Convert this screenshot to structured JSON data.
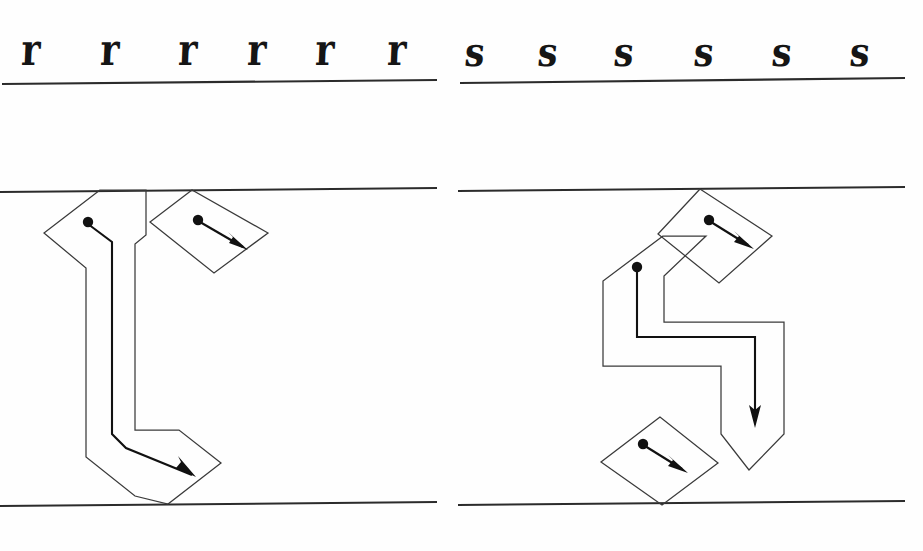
{
  "page": {
    "background_color": "#ffffff",
    "ink_color": "#2b2b2b",
    "width": 923,
    "height": 551
  },
  "specimen_row": {
    "left_group": {
      "letter": "r",
      "letter_name": "blackletter-lowercase-r",
      "count": 6,
      "repeats": [
        "r",
        "r",
        "r",
        "r",
        "r",
        "r"
      ],
      "x_positions": [
        25,
        105,
        184,
        252,
        320,
        392
      ],
      "baseline_y": 82,
      "rule_from_x": 2,
      "rule_to_x": 437
    },
    "right_group": {
      "letter": "s",
      "letter_name": "blackletter-lowercase-s",
      "count": 6,
      "repeats": [
        "s",
        "s",
        "s",
        "s",
        "s",
        "s"
      ],
      "x_positions": [
        472,
        544,
        620,
        700,
        778,
        856
      ],
      "baseline_y": 82,
      "rule_from_x": 460,
      "rule_to_x": 905
    }
  },
  "diagram_area": {
    "guides": {
      "waistline_y": 190,
      "baseline_y": 504,
      "left_panel": {
        "from_x": 0,
        "to_x": 437
      },
      "right_panel": {
        "from_x": 458,
        "to_x": 905
      }
    },
    "left_diagram": {
      "name": "letter-r-construction",
      "letter": "r",
      "stroke_count": 2,
      "strokes": [
        {
          "index": 1,
          "name": "r-stem-stroke",
          "description": "main descending stem with foot serif",
          "start_dot": [
            88,
            222
          ],
          "arrow_from": [
            88,
            222
          ],
          "arrow_to": [
            190,
            470
          ],
          "direction": "down then down-right"
        },
        {
          "index": 2,
          "name": "r-arm-stroke",
          "description": "short arm / shoulder flag",
          "start_dot": [
            198,
            219
          ],
          "arrow_from": [
            198,
            219
          ],
          "arrow_to": [
            245,
            249
          ],
          "direction": "down-right"
        }
      ]
    },
    "right_diagram": {
      "name": "letter-s-construction",
      "letter": "s",
      "stroke_count": 3,
      "strokes": [
        {
          "index": 1,
          "name": "s-top-flag-stroke",
          "description": "upper diagonal head stroke",
          "start_dot": [
            709,
            220
          ],
          "arrow_from": [
            709,
            220
          ],
          "arrow_to": [
            750,
            248
          ],
          "direction": "down-right"
        },
        {
          "index": 2,
          "name": "s-spine-stroke",
          "description": "main S spine descending",
          "start_dot": [
            637,
            267
          ],
          "arrow_from": [
            637,
            267
          ],
          "arrow_to": [
            755,
            423
          ],
          "direction": "down then right then down"
        },
        {
          "index": 3,
          "name": "s-bottom-flag-stroke",
          "description": "lower diagonal foot stroke",
          "start_dot": [
            643,
            444
          ],
          "arrow_from": [
            643,
            444
          ],
          "arrow_to": [
            688,
            472
          ],
          "direction": "down-right"
        }
      ]
    }
  },
  "legend": {
    "dot_meaning": "pen start position",
    "arrow_meaning": "stroke direction",
    "parallelogram_meaning": "broad-nib pen edge outline"
  }
}
